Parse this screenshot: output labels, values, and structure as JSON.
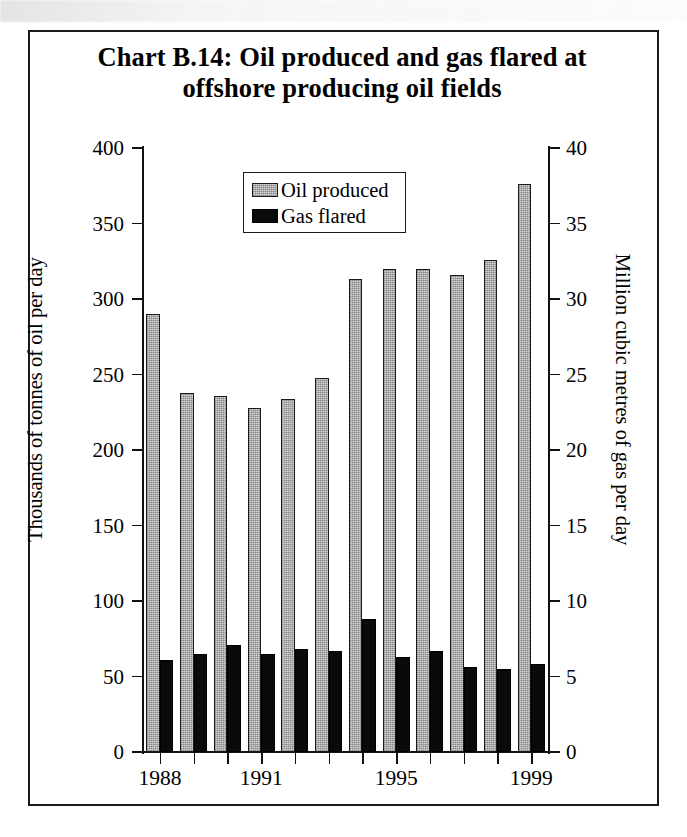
{
  "chart_data": {
    "type": "bar",
    "title": "Chart B.14:  Oil produced and gas flared at offshore producing oil fields",
    "title_line1": "Chart B.14:  Oil produced and gas flared at",
    "title_line2": "offshore producing oil fields",
    "subtitle": "",
    "xlabel": "",
    "ylabel": "Thousands of tonnes of oil per day",
    "ylabel_right": "Million cubic metres of gas per day",
    "grid": false,
    "legend_position": "top-center",
    "ylim": [
      0,
      400
    ],
    "ylim_right": [
      0,
      40
    ],
    "yticks": [
      "0",
      "50",
      "100",
      "150",
      "200",
      "250",
      "300",
      "350",
      "400"
    ],
    "yticks_right": [
      "0",
      "5",
      "10",
      "15",
      "20",
      "25",
      "30",
      "35",
      "40"
    ],
    "categories": [
      "1988",
      "1989",
      "1990",
      "1991",
      "1992",
      "1993",
      "1994",
      "1995",
      "1996",
      "1997",
      "1998",
      "1999"
    ],
    "xtick_labels": [
      "1988",
      "1991",
      "1995",
      "1999"
    ],
    "xtick_label_indices": [
      0,
      3,
      7,
      11
    ],
    "series": [
      {
        "name": "Oil produced",
        "axis": "left",
        "units": "Thousands of tonnes of oil per day",
        "color": "#D8D8D8",
        "values": [
          290,
          238,
          236,
          228,
          234,
          248,
          313,
          320,
          320,
          316,
          326,
          376
        ]
      },
      {
        "name": "Gas flared",
        "axis": "right",
        "units": "Million cubic metres of gas per day",
        "color": "#0A0A0A",
        "values_left_scale": [
          61,
          65,
          71,
          65,
          68,
          67,
          88,
          63,
          67,
          56,
          55,
          58
        ],
        "values": [
          6.1,
          6.5,
          7.1,
          6.5,
          6.8,
          6.7,
          8.8,
          6.3,
          6.7,
          5.6,
          5.5,
          5.8
        ]
      }
    ],
    "legend": [
      {
        "label": "Oil produced",
        "swatch": "oil"
      },
      {
        "label": "Gas flared",
        "swatch": "gas"
      }
    ]
  }
}
